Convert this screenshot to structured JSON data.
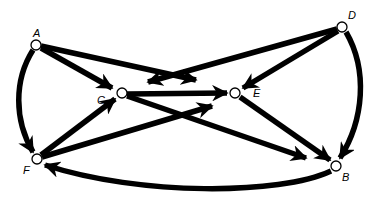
{
  "diagram": {
    "type": "directed-graph",
    "colors": {
      "edge": "#000000",
      "node_fill": "#ffffff",
      "background": "#ffffff"
    },
    "nodes": [
      {
        "id": "A",
        "label": "A",
        "x": 36,
        "y": 45,
        "lx": 36,
        "ly": 36
      },
      {
        "id": "D",
        "label": "D",
        "x": 342,
        "y": 27,
        "lx": 352,
        "ly": 18
      },
      {
        "id": "C",
        "label": "C",
        "x": 122,
        "y": 93,
        "lx": 101,
        "ly": 103
      },
      {
        "id": "E",
        "label": "E",
        "x": 235,
        "y": 93,
        "lx": 256,
        "ly": 97
      },
      {
        "id": "F",
        "label": "F",
        "x": 37,
        "y": 159,
        "lx": 27,
        "ly": 173
      },
      {
        "id": "B",
        "label": "B",
        "x": 336,
        "y": 166,
        "lx": 345,
        "ly": 180
      }
    ],
    "edges": [
      {
        "from": "A",
        "to": "C",
        "label": "A-to-C"
      },
      {
        "from": "A",
        "to": "E",
        "label": "A-to-E (stops short)"
      },
      {
        "from": "D",
        "to": "C",
        "label": "D-to-C (stops short)"
      },
      {
        "from": "D",
        "to": "E",
        "label": "D-to-E"
      },
      {
        "from": "C",
        "to": "E",
        "label": "C-to-E"
      },
      {
        "from": "C",
        "to": "B",
        "label": "C-to-B"
      },
      {
        "from": "F",
        "to": "C",
        "label": "F-to-C"
      },
      {
        "from": "F",
        "to": "E",
        "label": "F-to-E"
      },
      {
        "from": "E",
        "to": "B",
        "label": "E-to-B"
      },
      {
        "from": "A",
        "to": "F",
        "label": "A-to-F (curved)"
      },
      {
        "from": "D",
        "to": "B",
        "label": "D-to-B (curved)"
      },
      {
        "from": "B",
        "to": "F",
        "label": "B-to-F (curved)"
      }
    ]
  }
}
